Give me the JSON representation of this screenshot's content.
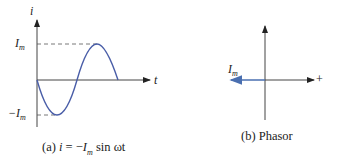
{
  "panel_a": {
    "y_axis_label": "i",
    "x_axis_label": "t",
    "peak_label": "I",
    "peak_sub": "m",
    "trough_label": "−I",
    "trough_sub": "m",
    "caption_prefix": "(a) ",
    "caption_var": "i",
    "caption_eq": " = −",
    "caption_im": "I",
    "caption_im_sub": "m",
    "caption_tail": " sin ωt"
  },
  "panel_b": {
    "phasor_label": "I",
    "phasor_sub": "m",
    "axis_plus": "+",
    "caption": "(b) Phasor"
  },
  "colors": {
    "wave": "#4a5ea8",
    "axis": "#333333",
    "phasor": "#4a6fb0"
  }
}
